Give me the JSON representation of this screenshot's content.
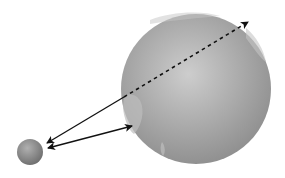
{
  "diagram": {
    "colors": {
      "background": "#ffffff",
      "earth_light": "#c9c9c9",
      "earth_mid": "#a3a3a3",
      "earth_dark": "#8a8a8a",
      "land": "#bdbdbd",
      "moon_light": "#a8a8a8",
      "moon_dark": "#6f6f6f",
      "arrow": "#111111"
    },
    "earth": {
      "cx": 196,
      "cy": 89,
      "r": 75
    },
    "moon": {
      "cx": 30,
      "cy": 152,
      "r": 13
    },
    "arrows": [
      {
        "name": "near-side-arrow",
        "x1": 124,
        "y1": 97,
        "x2": 47,
        "y2": 143,
        "style": "solid"
      },
      {
        "name": "tangent-arrow",
        "x1": 132,
        "y1": 126,
        "x2": 48,
        "y2": 148,
        "style": "solid-double"
      },
      {
        "name": "through-earth-arrow",
        "x1": 124,
        "y1": 97,
        "x2": 248,
        "y2": 22,
        "style": "dashed"
      }
    ]
  }
}
